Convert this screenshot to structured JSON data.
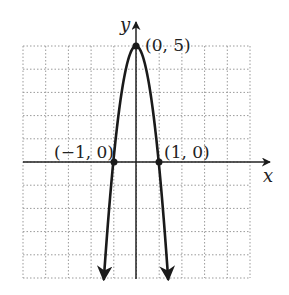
{
  "graph": {
    "x_axis_label": "x",
    "y_axis_label": "y",
    "points": [
      {
        "label": "(0, 5)",
        "x": 0,
        "y": 5
      },
      {
        "label": "(−1, 0)",
        "x": -1,
        "y": 0
      },
      {
        "label": "(1, 0)",
        "x": 1,
        "y": 0
      }
    ],
    "colors": {
      "curve": "#1a1a1a",
      "grid": "#9a9a9a",
      "axis": "#222222"
    }
  },
  "chart_data": {
    "type": "line",
    "title": "",
    "xlabel": "x",
    "ylabel": "y",
    "xlim": [
      -5,
      5
    ],
    "ylim": [
      -5,
      5
    ],
    "grid": true,
    "function": "y = 5 - 5x^2",
    "series": [
      {
        "name": "parabola",
        "x": [
          -1.2,
          -1,
          -0.5,
          0,
          0.5,
          1,
          1.2
        ],
        "y": [
          -2.2,
          0,
          3.75,
          5,
          3.75,
          0,
          -2.2
        ]
      }
    ],
    "annotations": [
      "(0, 5)",
      "(−1, 0)",
      "(1, 0)"
    ]
  }
}
